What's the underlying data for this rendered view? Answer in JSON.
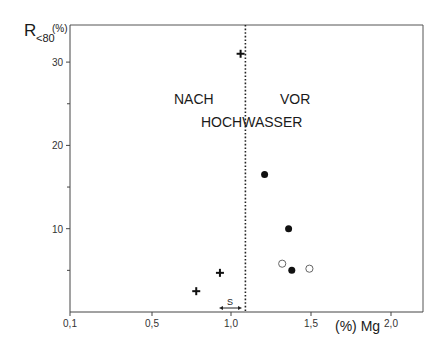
{
  "chart_data": {
    "type": "scatter",
    "title": "",
    "xlabel": "(%) Mg",
    "ylabel": "R<80 (%)",
    "ylabel_main": "R",
    "ylabel_sub": "<80",
    "ylabel_unit": "(%)",
    "xlim": [
      0.1,
      2.2
    ],
    "ylim": [
      0,
      35
    ],
    "x_ticks": [
      {
        "label": "0,1",
        "value": 0.1
      },
      {
        "label": "0,5",
        "value": 0.5
      },
      {
        "label": "1,0",
        "value": 1.0
      },
      {
        "label": "1,5",
        "value": 1.5
      },
      {
        "label": "2,0",
        "value": 2.0
      }
    ],
    "y_ticks": [
      {
        "label": "10",
        "value": 10
      },
      {
        "label": "20",
        "value": 20
      },
      {
        "label": "30",
        "value": 30
      }
    ],
    "y_minor_ticks": [
      5,
      15,
      25
    ],
    "grid": false,
    "divider": {
      "x": 1.09,
      "style": "dotted"
    },
    "annotations": {
      "left": "NACH",
      "right": "VOR",
      "center": "HOCHWASSER",
      "s_marker": "S"
    },
    "series": [
      {
        "name": "nach Hochwasser (+)",
        "marker": "plus",
        "points": [
          [
            1.06,
            31.0
          ],
          [
            0.78,
            2.5
          ],
          [
            0.93,
            4.7
          ]
        ]
      },
      {
        "name": "vor Hochwasser (filled)",
        "marker": "filled-circle",
        "points": [
          [
            1.21,
            16.5
          ],
          [
            1.36,
            10.0
          ],
          [
            1.38,
            5.0
          ]
        ]
      },
      {
        "name": "vor Hochwasser (open)",
        "marker": "open-circle",
        "points": [
          [
            1.32,
            5.8
          ],
          [
            1.49,
            5.2
          ]
        ]
      }
    ]
  }
}
